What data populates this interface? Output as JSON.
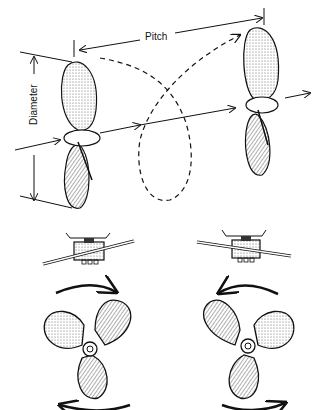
{
  "diagram": {
    "labels": {
      "pitch": "Pitch",
      "diameter": "Diameter"
    },
    "sections": [
      {
        "name": "pitch-diameter-illustration",
        "description": "Two-blade propeller advancing along shaft axis showing pitch and diameter"
      },
      {
        "name": "right-hand-propeller",
        "rotation": "clockwise"
      },
      {
        "name": "left-hand-propeller",
        "rotation": "counter-clockwise"
      }
    ],
    "colors": {
      "ink": "#111111",
      "background": "#ffffff"
    }
  }
}
